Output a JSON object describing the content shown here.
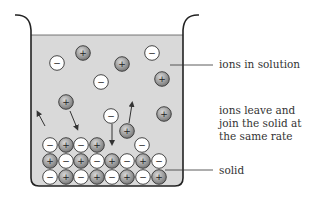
{
  "diagram": {
    "labels": {
      "ions_in_solution": "ions in solution",
      "equilibrium_line1": "ions leave and",
      "equilibrium_line2": "join the solid at",
      "equilibrium_line3": "the same rate",
      "solid": "solid"
    },
    "colors": {
      "liquid": "#d9d9d9",
      "outline": "#222222",
      "positive_ion": "#9a9a9a",
      "negative_ion": "#ffffff"
    },
    "ion_symbols": {
      "positive": "+",
      "negative": "−"
    },
    "free_ions": [
      {
        "x": 57,
        "y": 63,
        "charge": "negative"
      },
      {
        "x": 83,
        "y": 53,
        "charge": "positive"
      },
      {
        "x": 122,
        "y": 64,
        "charge": "positive"
      },
      {
        "x": 152,
        "y": 53,
        "charge": "negative"
      },
      {
        "x": 101,
        "y": 82,
        "charge": "negative"
      },
      {
        "x": 162,
        "y": 79,
        "charge": "positive"
      },
      {
        "x": 66,
        "y": 102,
        "charge": "positive"
      },
      {
        "x": 111,
        "y": 116,
        "charge": "negative"
      },
      {
        "x": 127,
        "y": 131,
        "charge": "positive"
      },
      {
        "x": 164,
        "y": 114,
        "charge": "positive"
      },
      {
        "x": 142,
        "y": 145,
        "charge": "negative"
      }
    ],
    "solid_rows": [
      {
        "y": 177,
        "x": [
          50,
          66,
          81,
          97,
          112,
          127,
          143,
          159
        ],
        "charges": [
          "negative",
          "positive",
          "negative",
          "positive",
          "negative",
          "positive",
          "negative",
          "positive"
        ]
      },
      {
        "y": 161,
        "x": [
          50,
          66,
          81,
          97,
          112,
          127,
          143,
          159
        ],
        "charges": [
          "positive",
          "negative",
          "positive",
          "negative",
          "positive",
          "negative",
          "positive",
          "negative"
        ]
      },
      {
        "y": 145,
        "x": [
          50,
          66,
          81,
          97
        ],
        "charges": [
          "negative",
          "positive",
          "negative",
          "positive"
        ]
      }
    ]
  }
}
